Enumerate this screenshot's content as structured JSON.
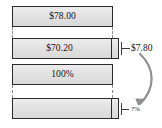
{
  "diagram": {
    "type": "tape-diagram",
    "bars": [
      {
        "id": "bar-original-price",
        "label": "$78.00",
        "full_width": true,
        "has_remainder_segment": false
      },
      {
        "id": "bar-sale-price",
        "label": "$70.20",
        "full_width": false,
        "has_remainder_segment": true
      },
      {
        "id": "bar-original-percent",
        "label": "100%",
        "full_width": true,
        "has_remainder_segment": false
      },
      {
        "id": "bar-sale-percent",
        "label": "",
        "full_width": false,
        "has_remainder_segment": true
      }
    ],
    "annotations": [
      {
        "id": "difference-amount",
        "text": "$7.80"
      },
      {
        "id": "unknown-percent",
        "text": "?%"
      }
    ],
    "colors": {
      "bar_fill": "#e4e4e4",
      "bar_stroke": "#2b2b2b",
      "guide_line": "#8c8c8c",
      "text": "#141414",
      "arrow": "#7a7a7a"
    }
  }
}
